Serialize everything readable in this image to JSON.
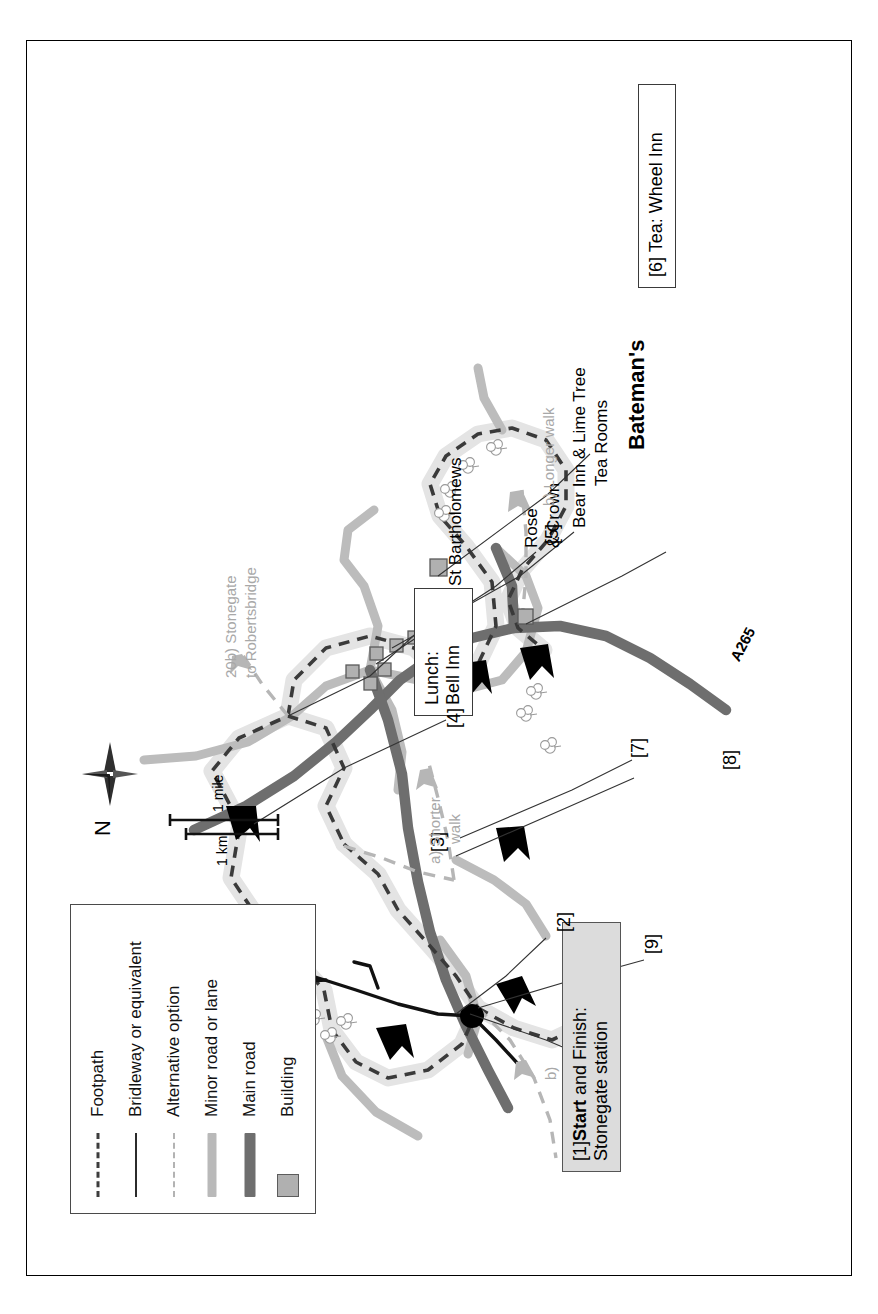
{
  "map": {
    "title_context": "Circular walk map",
    "legend": {
      "items": [
        {
          "key": "footpath-dashed",
          "label": "Footpath"
        },
        {
          "key": "bridleway-solid",
          "label": "Bridleway or equivalent"
        },
        {
          "key": "alternative-dashed",
          "label": "Alternative option"
        },
        {
          "key": "minor-road-band",
          "label": "Minor road or lane"
        },
        {
          "key": "main-road-band",
          "label": "Main road"
        },
        {
          "key": "building-square",
          "label": "Building"
        }
      ]
    },
    "compass": {
      "north_label": "N",
      "icon": "compass-star-icon"
    },
    "scale": {
      "bars": [
        {
          "label": "1 km",
          "length_px": 92
        },
        {
          "label": "1 mile",
          "length_px": 148
        }
      ]
    },
    "callouts": [
      {
        "id": "start-finish",
        "marker": "[1]",
        "bold_text": "Start",
        "rest_text": " and Finish:",
        "line2": "Stonegate station",
        "shaded": true
      },
      {
        "id": "lunch",
        "line1": "Lunch:",
        "line2": "Bell Inn",
        "shaded": false
      },
      {
        "id": "tea",
        "line1": "[6] Tea: Wheel Inn",
        "shaded": false
      }
    ],
    "waypoints": [
      {
        "label": "[2]"
      },
      {
        "label": "[3]"
      },
      {
        "label": "[4]"
      },
      {
        "label": "[5]"
      },
      {
        "label": "[7]"
      },
      {
        "label": "[8]"
      },
      {
        "label": "[9]"
      }
    ],
    "place_labels": [
      {
        "id": "st-bartholomews",
        "text": "St Bartholomews",
        "tone": "black"
      },
      {
        "id": "rose-and-crown",
        "text": "Rose",
        "tone": "black"
      },
      {
        "id": "rose-and-crown-2",
        "text": "& Crown",
        "tone": "black"
      },
      {
        "id": "bear-inn",
        "text": "Bear Inn & Lime Tree",
        "tone": "black"
      },
      {
        "id": "bear-inn-2",
        "text": "Tea Rooms",
        "tone": "black"
      },
      {
        "id": "batemans",
        "text": "Bateman's",
        "tone": "black"
      },
      {
        "id": "road-a265",
        "text": "A265",
        "tone": "black"
      }
    ],
    "route_options": [
      {
        "id": "link-20b-l1",
        "text": "20b) Stonegate",
        "tone": "gray"
      },
      {
        "id": "link-20b-l2",
        "text": "to Robertsbridge",
        "tone": "gray"
      },
      {
        "id": "shorter-l1",
        "text": "a) Shorter",
        "tone": "gray"
      },
      {
        "id": "shorter-l2",
        "text": "walk",
        "tone": "gray"
      },
      {
        "id": "longer",
        "text": "b) Longer walk",
        "tone": "gray"
      },
      {
        "id": "b-tick",
        "text": "b)",
        "tone": "gray"
      }
    ],
    "colors": {
      "main_road": "#6e6e6e",
      "minor_road": "#b9b9b9",
      "footpath": "#3d3d3d",
      "footpath_halo": "#e2e2e2",
      "alternative": "#b3b3b3",
      "building": "#b0b0b0",
      "callout_shade": "#dcdcdc",
      "ink": "#000000",
      "gray_text": "#a8a8a8"
    }
  }
}
